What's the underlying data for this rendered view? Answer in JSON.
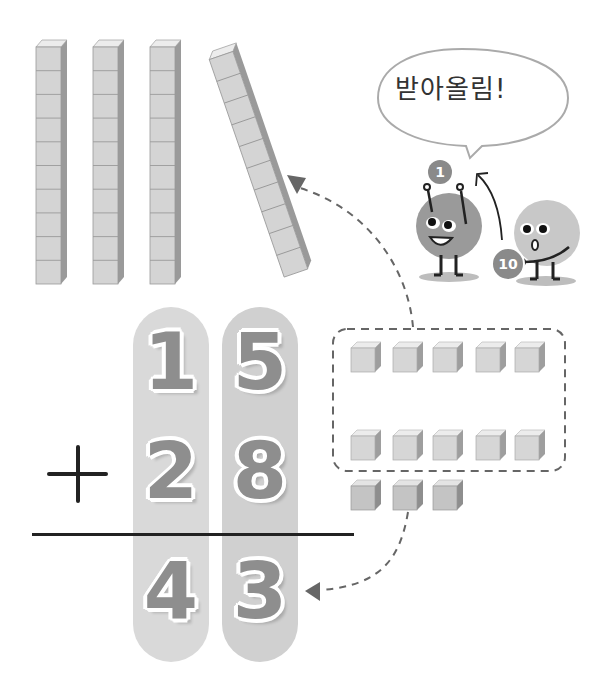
{
  "speech_bubble": {
    "text": "받아올림!"
  },
  "characters": {
    "left_badge": "1",
    "right_badge": "10"
  },
  "operator": "+",
  "addition": {
    "top": {
      "tens": "1",
      "ones": "5"
    },
    "bottom": {
      "tens": "2",
      "ones": "8"
    },
    "result": {
      "tens": "4",
      "ones": "3"
    }
  },
  "blocks": {
    "tens_rods_upright": 3,
    "tens_rod_regrouped": 1,
    "cubes_per_rod": 10,
    "unit_cubes_grouped": 10,
    "unit_cubes_remaining": 3
  },
  "colors": {
    "pill_left": "#d9d9d9",
    "pill_right": "#d0d0d0",
    "digit_fill": "#8e8e8e",
    "cube_face": "#d4d4d4",
    "cube_top": "#ececec",
    "cube_side": "#9a9a9a",
    "line": "#222222",
    "dash": "#666666"
  }
}
